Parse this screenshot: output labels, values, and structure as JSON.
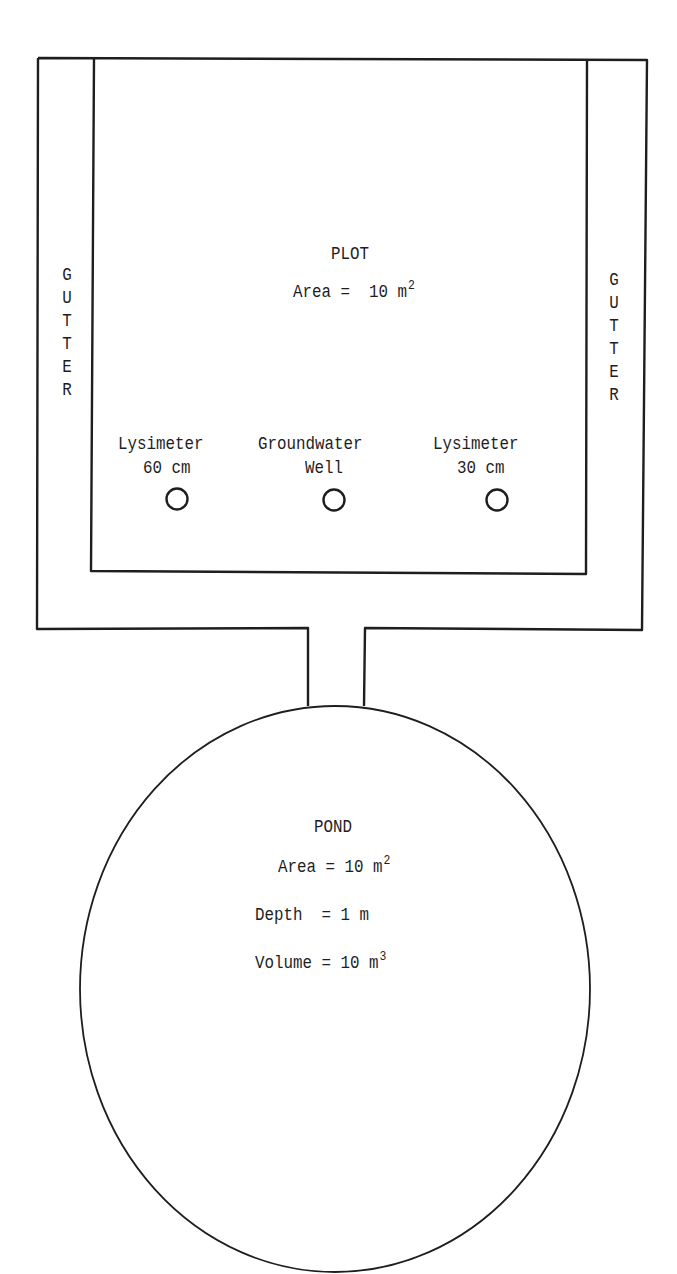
{
  "diagram": {
    "plot": {
      "title": "PLOT",
      "area_label": "Area =  10 m",
      "area_exp": "2"
    },
    "gutters": {
      "left": [
        "G",
        "U",
        "T",
        "T",
        "E",
        "R"
      ],
      "right": [
        "G",
        "U",
        "T",
        "T",
        "E",
        "R"
      ]
    },
    "instruments": [
      {
        "line1": "Lysimeter",
        "line2": "60 cm"
      },
      {
        "line1": "Groundwater",
        "line2": "Well"
      },
      {
        "line1": "Lysimeter",
        "line2": "30 cm"
      }
    ],
    "pond": {
      "title": "POND",
      "area_label": "Area = 10 m",
      "area_exp": "2",
      "depth_label": "Depth  = 1 m",
      "volume_label": "Volume = 10 m",
      "volume_exp": "3"
    },
    "colors": {
      "stroke": "#1e1e1e",
      "background": "#ffffff"
    }
  }
}
